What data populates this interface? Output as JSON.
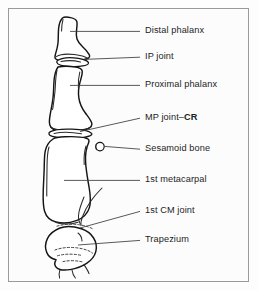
{
  "figure": {
    "background_color": "#fcfcfc",
    "frame_color": "#9a9a9a",
    "line_color": "#151515",
    "text_color": "#1d1d1d"
  },
  "labels": [
    {
      "id": "distal-phalanx",
      "text": "Distal phalanx",
      "x": 145,
      "y": 26,
      "bold_suffix": ""
    },
    {
      "id": "ip-joint",
      "text": "IP joint",
      "x": 145,
      "y": 52,
      "bold_suffix": ""
    },
    {
      "id": "proximal-phalanx",
      "text": "Proximal phalanx",
      "x": 145,
      "y": 80,
      "bold_suffix": ""
    },
    {
      "id": "mp-joint-cr",
      "text": "MP joint–",
      "x": 145,
      "y": 113,
      "bold_suffix": "CR"
    },
    {
      "id": "sesamoid-bone",
      "text": "Sesamoid bone",
      "x": 145,
      "y": 144,
      "bold_suffix": ""
    },
    {
      "id": "first-metacarpal",
      "text": "1st metacarpal",
      "x": 145,
      "y": 175,
      "bold_suffix": ""
    },
    {
      "id": "first-cm-joint",
      "text": "1st CM joint",
      "x": 145,
      "y": 206,
      "bold_suffix": ""
    },
    {
      "id": "trapezium",
      "text": "Trapezium",
      "x": 145,
      "y": 235,
      "bold_suffix": ""
    }
  ],
  "structures": [
    {
      "id": "distal-phalanx",
      "name": "Distal phalanx"
    },
    {
      "id": "ip-joint",
      "name": "IP joint"
    },
    {
      "id": "proximal-phalanx",
      "name": "Proximal phalanx"
    },
    {
      "id": "mp-joint",
      "name": "MP joint"
    },
    {
      "id": "sesamoid-bone",
      "name": "Sesamoid bone"
    },
    {
      "id": "first-metacarpal",
      "name": "1st metacarpal"
    },
    {
      "id": "first-cm-joint",
      "name": "1st CM joint"
    },
    {
      "id": "trapezium",
      "name": "Trapezium"
    }
  ]
}
